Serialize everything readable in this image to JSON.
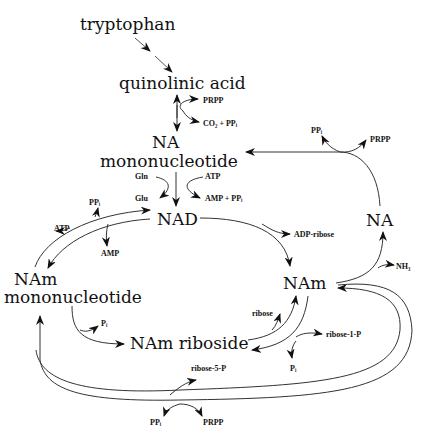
{
  "diagram": {
    "nodes": {
      "tryptophan": "tryptophan",
      "quinolinic_acid": "quinolinic acid",
      "na_mononucleotide_line1": "NA",
      "na_mononucleotide_line2": "mononucleotide",
      "nad": "NAD",
      "na": "NA",
      "nam": "NAm",
      "nam_mononucleotide_line1": "NAm",
      "nam_mononucleotide_line2": "mononucleotide",
      "nam_riboside": "NAm riboside"
    },
    "cofactors": {
      "prpp_quin": "PRPP",
      "co2_ppi": "CO₂ + PPᵢ",
      "gln": "Gln",
      "atp_nad": "ATP",
      "glu": "Glu",
      "amp_ppi": "AMP + PPᵢ",
      "ppi_na": "PPᵢ",
      "prpp_na": "PRPP",
      "ppi_namn": "PPᵢ",
      "atp_namn": "ATP",
      "amp_namn": "AMP",
      "adp_ribose": "ADP-ribose",
      "nh3": "NH₃",
      "pi_riboside": "Pᵢ",
      "ribose": "ribose",
      "ribose_1_p": "ribose-1-P",
      "pi_nam": "Pᵢ",
      "ribose_5_p": "ribose-5-P",
      "ppi_bottom": "PPᵢ",
      "prpp_bottom": "PRPP"
    },
    "edges": [
      {
        "from": "tryptophan",
        "to": "quinolinic acid"
      },
      {
        "from": "quinolinic acid",
        "to": "NA mononucleotide",
        "reversible": true,
        "inputs": [
          "PRPP"
        ],
        "outputs": [
          "CO2 + PPi"
        ]
      },
      {
        "from": "NA mononucleotide",
        "to": "NAD",
        "inputs": [
          "Gln",
          "ATP"
        ],
        "outputs": [
          "Glu",
          "AMP + PPi"
        ]
      },
      {
        "from": "NA",
        "to": "NA mononucleotide",
        "inputs": [
          "PRPP"
        ],
        "outputs": [
          "PPi"
        ]
      },
      {
        "from": "NAm",
        "to": "NA",
        "outputs": [
          "NH3"
        ]
      },
      {
        "from": "NAD",
        "to": "NAm",
        "outputs": [
          "ADP-ribose"
        ]
      },
      {
        "from": "NAD",
        "to": "NAm mononucleotide",
        "outputs": [
          "AMP"
        ]
      },
      {
        "from": "NAm mononucleotide",
        "to": "NAD",
        "inputs": [
          "ATP"
        ],
        "outputs": [
          "PPi"
        ]
      },
      {
        "from": "NAm mononucleotide",
        "to": "NAm riboside",
        "outputs": [
          "Pi"
        ]
      },
      {
        "from": "NAm riboside",
        "to": "NAm",
        "outputs": [
          "ribose"
        ]
      },
      {
        "from": "NAm",
        "to": "NAm riboside",
        "inputs": [
          "ribose-1-P"
        ],
        "outputs": [
          "Pi"
        ]
      },
      {
        "from": "NAm",
        "to": "NAm mononucleotide",
        "inputs": [
          "PRPP"
        ],
        "outputs": [
          "PPi"
        ]
      },
      {
        "from": "NAm mononucleotide",
        "to": "NAm",
        "outputs": [
          "ribose-5-P"
        ]
      }
    ]
  }
}
